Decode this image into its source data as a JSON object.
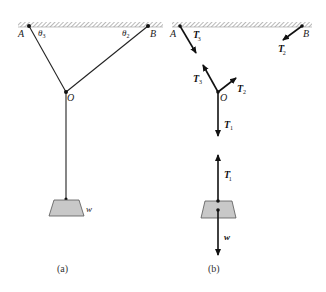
{
  "figure": {
    "panel_a": {
      "caption": "(a)",
      "labels": {
        "A": "A",
        "B": "B",
        "O": "O",
        "theta3": "θ",
        "theta3_sub": "3",
        "theta2": "θ",
        "theta2_sub": "2",
        "w": "w"
      }
    },
    "panel_b": {
      "caption": "(b)",
      "labels": {
        "A": "A",
        "B": "B",
        "O": "O",
        "T3p": "T",
        "T3p_sub": "3",
        "T2p": "T",
        "T2p_sub": "2",
        "T3": "T",
        "T3_sub": "3",
        "T2": "T",
        "T2_sub": "2",
        "T1": "T",
        "T1_sub": "1",
        "T1p": "T",
        "T1p_sub": "1",
        "w": "w",
        "prime": "′"
      }
    },
    "colors": {
      "line": "#222222",
      "weight_fill": "#c8c8c8",
      "hatch": "#888888"
    }
  }
}
